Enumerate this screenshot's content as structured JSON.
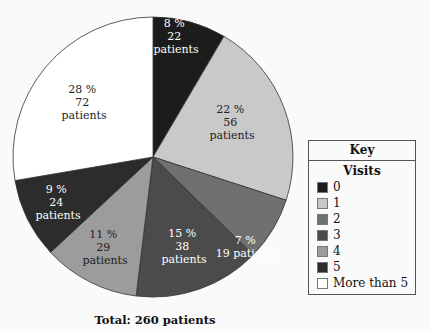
{
  "chart_data": {
    "type": "pie",
    "title": "",
    "footer": "Total: 260 patients",
    "legend": {
      "title": "Key",
      "subtitle": "Visits",
      "position": "right"
    },
    "categories": [
      "0",
      "1",
      "2",
      "3",
      "4",
      "5",
      "More than 5"
    ],
    "percent": [
      8,
      22,
      7,
      15,
      11,
      9,
      28
    ],
    "values": [
      22,
      56,
      19,
      38,
      29,
      24,
      72
    ],
    "colors": [
      "#1c1c1c",
      "#c9c9c9",
      "#707070",
      "#4b4b4b",
      "#9c9c9c",
      "#2c2c2c",
      "#ffffff"
    ],
    "label_colors": [
      "#ffffff",
      "#222222",
      "#ffffff",
      "#ffffff",
      "#222222",
      "#ffffff",
      "#222222"
    ],
    "total": 260
  },
  "slices": [
    {
      "pct": "8 %",
      "count": "22",
      "unit": "patients"
    },
    {
      "pct": "22 %",
      "count": "56",
      "unit": "patients"
    },
    {
      "pct": "7 %",
      "count": "19 patients",
      "unit": ""
    },
    {
      "pct": "15 %",
      "count": "38",
      "unit": "patients"
    },
    {
      "pct": "11 %",
      "count": "29",
      "unit": "patients"
    },
    {
      "pct": "9 %",
      "count": "24",
      "unit": "patients"
    },
    {
      "pct": "28 %",
      "count": "72",
      "unit": "patients"
    }
  ],
  "key": {
    "title": "Key",
    "subtitle": "Visits",
    "items": [
      "0",
      "1",
      "2",
      "3",
      "4",
      "5",
      "More than 5"
    ]
  },
  "footer": "Total: 260 patients"
}
